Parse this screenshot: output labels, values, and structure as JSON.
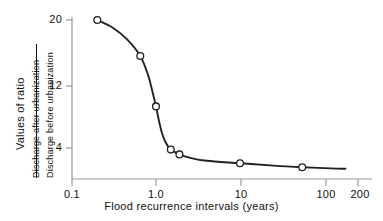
{
  "chart_data": {
    "type": "line",
    "title": "",
    "xlabel": "Flood recurrence intervals (years)",
    "ylabel": "Values of ratio",
    "ylabel_fraction_numerator": "Discharge after urbanization",
    "ylabel_fraction_denominator": "Discharge before urbanization",
    "xscale": "log",
    "yscale": "linear",
    "xlim": [
      0.1,
      200
    ],
    "ylim": [
      1.0,
      20
    ],
    "grid": false,
    "legend": null,
    "xticks": [
      {
        "value": 0.1,
        "label": "0.1"
      },
      {
        "value": 1.0,
        "label": "1.0"
      },
      {
        "value": 10,
        "label": "10"
      },
      {
        "value": 100,
        "label": "100"
      },
      {
        "value": 200,
        "label": "200"
      }
    ],
    "yticks": [
      {
        "value": 20,
        "label": "20"
      },
      {
        "value": 12,
        "label": "12"
      },
      {
        "value": 4,
        "label": "4"
      }
    ],
    "series": [
      {
        "name": "Ratio of discharge after to before urbanization",
        "marker": "open-circle",
        "x": [
          0.2,
          0.65,
          1.0,
          1.5,
          1.9,
          10,
          55
        ],
        "y": [
          20.0,
          15.5,
          9.2,
          3.8,
          3.2,
          2.1,
          1.6
        ]
      }
    ],
    "curve_points": [
      {
        "x": 0.2,
        "y": 20.0
      },
      {
        "x": 0.3,
        "y": 19.1
      },
      {
        "x": 0.45,
        "y": 17.6
      },
      {
        "x": 0.65,
        "y": 15.5
      },
      {
        "x": 0.8,
        "y": 13.2
      },
      {
        "x": 0.9,
        "y": 11.2
      },
      {
        "x": 1.0,
        "y": 9.2
      },
      {
        "x": 1.1,
        "y": 7.1
      },
      {
        "x": 1.2,
        "y": 5.6
      },
      {
        "x": 1.35,
        "y": 4.4
      },
      {
        "x": 1.5,
        "y": 3.8
      },
      {
        "x": 1.9,
        "y": 3.2
      },
      {
        "x": 2.5,
        "y": 2.8
      },
      {
        "x": 4.0,
        "y": 2.4
      },
      {
        "x": 10,
        "y": 2.1
      },
      {
        "x": 25,
        "y": 1.8
      },
      {
        "x": 55,
        "y": 1.6
      },
      {
        "x": 120,
        "y": 1.45
      },
      {
        "x": 180,
        "y": 1.4
      }
    ],
    "colors": {
      "line": "#222222",
      "marker_face": "#ffffff",
      "marker_edge": "#222222",
      "axis": "#999999",
      "text": "#111111",
      "background": "#ffffff"
    }
  }
}
